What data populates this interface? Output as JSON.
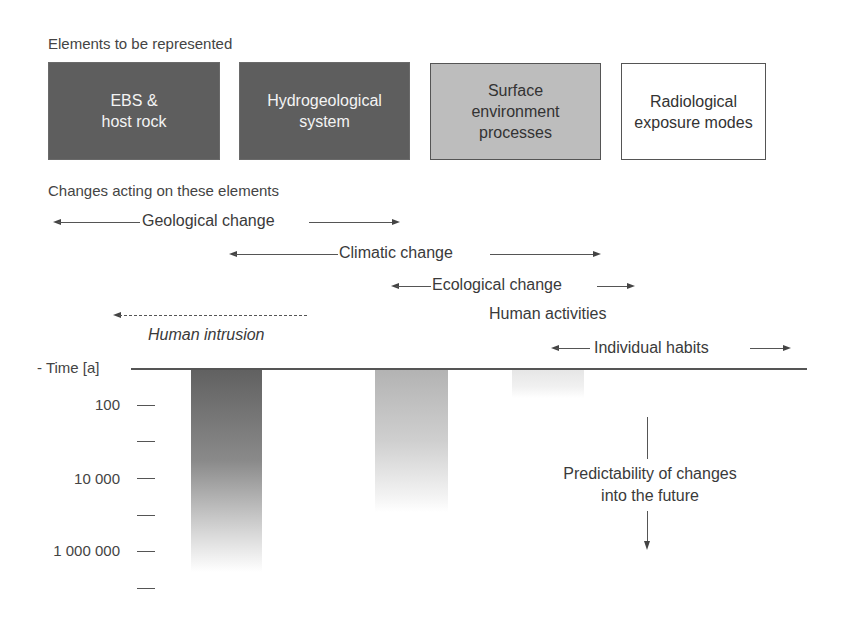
{
  "headings": {
    "elements": "Elements to be represented",
    "changes": "Changes acting on these elements"
  },
  "elements": [
    {
      "line1": "EBS &",
      "line2": "host rock",
      "line3": "",
      "shade": "dark"
    },
    {
      "line1": "Hydrogeological",
      "line2": "system",
      "line3": "",
      "shade": "dark"
    },
    {
      "line1": "Surface",
      "line2": "environment",
      "line3": "processes",
      "shade": "mid"
    },
    {
      "line1": "Radiological",
      "line2": "exposure modes",
      "line3": "",
      "shade": "light"
    }
  ],
  "changes": {
    "geological": "Geological change",
    "climatic": "Climatic change",
    "ecological": "Ecological change",
    "human_activities": "Human activities",
    "human_intrusion": "Human intrusion",
    "individual_habits": "Individual habits"
  },
  "axis": {
    "title": "- Time [a]",
    "ticks": [
      "100",
      "",
      "10 000",
      "",
      "1 000 000",
      ""
    ]
  },
  "predictability": {
    "line1": "Predictability of changes",
    "line2": "into the future"
  },
  "colors": {
    "dark_box": "#5e5e5e",
    "mid_box": "#bdbdbd",
    "light_box": "#ffffff",
    "line": "#555555"
  }
}
